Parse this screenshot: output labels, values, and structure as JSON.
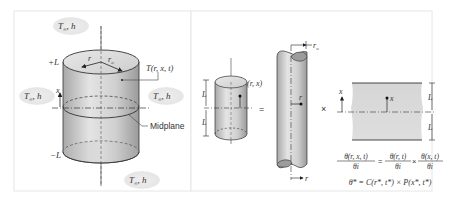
{
  "panels": {
    "left": {
      "ambient_labels": [
        "T∞, h",
        "T∞, h",
        "T∞, h",
        "T∞, h"
      ],
      "ambient_symbol": "T",
      "ambient_subscript": "∞",
      "ambient_suffix": ", h",
      "top_label": "+L",
      "bottom_label": "−L",
      "x_label": "x",
      "r_label": "r",
      "ro_label": "r",
      "ro_subscript": "o",
      "temperature_label": "T(r, x, t)",
      "midplane_label": "Midplane"
    },
    "right": {
      "finite_cylinder": {
        "point_label": "(r, x)",
        "L_upper": "L",
        "L_lower": "L"
      },
      "equals_sign": "=",
      "infinite_cylinder": {
        "ro_label": "r",
        "ro_subscript": "o",
        "r_label": "r",
        "r_axis_label": "r"
      },
      "times_sign": "×",
      "plane_wall": {
        "x_axis_label": "x",
        "point_label": "x",
        "L_upper": "L",
        "L_lower": "L"
      },
      "equation_1": {
        "lhs_num": "θ(r, x, t)",
        "lhs_den": "θi",
        "eq": "=",
        "mid_num": "θ(r, t)",
        "mid_den": "θi",
        "times": "×",
        "rhs_num": "θ(x, t)",
        "rhs_den": "θi"
      },
      "equation_2": "θ* = C(r*, t*) × P(x*, t*)"
    }
  }
}
